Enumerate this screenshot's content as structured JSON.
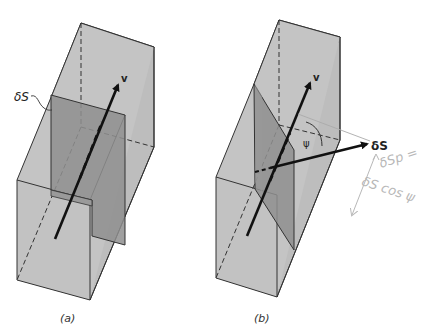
{
  "figure": {
    "panels": [
      {
        "id": "a",
        "caption": "(a)",
        "labels": {
          "surface": "δS",
          "velocity": "v"
        },
        "description": "Rectangular flow tube with a surface element δS perpendicular to velocity v"
      },
      {
        "id": "b",
        "caption": "(b)",
        "labels": {
          "surface_vector": "δS",
          "velocity": "v",
          "angle": "ψ"
        },
        "annotation": {
          "line1": "δSp =",
          "line2": "δS cos ψ"
        },
        "description": "Flow tube with an inclined surface element; normal δS at angle ψ to velocity v"
      }
    ],
    "colors": {
      "face_light": "#c4c4c4",
      "face_mid": "#b2b2b2",
      "surface_dark": "#8f8f8f",
      "edge": "#333333",
      "annotation": "#b8b8b8"
    }
  }
}
